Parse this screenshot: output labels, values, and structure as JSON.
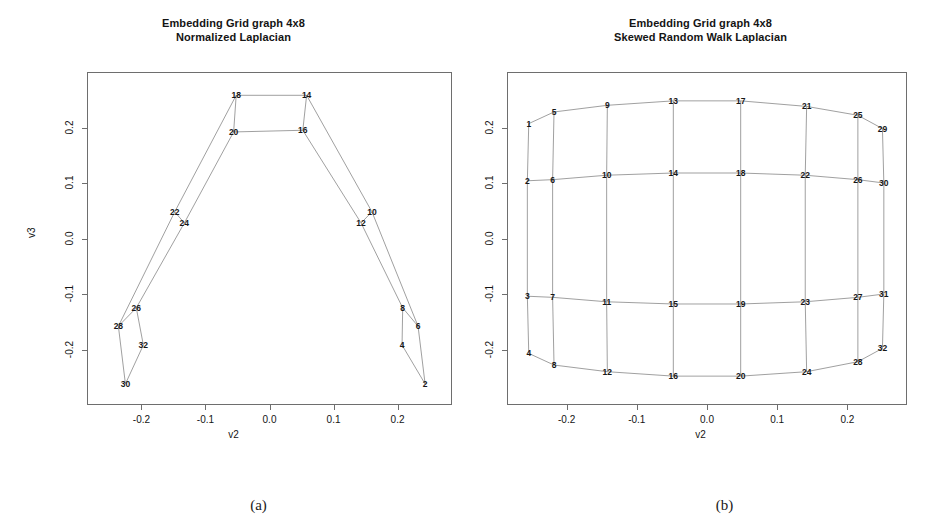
{
  "figure": {
    "panels": [
      {
        "caption": "(a)",
        "title_line1": "Embedding Grid graph 4x8",
        "title_line2": "Normalized Laplacian"
      },
      {
        "caption": "(b)",
        "title_line1": "Embedding Grid graph 4x8",
        "title_line2": "Skewed Random Walk  Laplacian"
      }
    ]
  },
  "chart_data": [
    {
      "type": "scatter",
      "title": "Embedding Grid graph 4x8 Normalized Laplacian",
      "xlabel": "v2",
      "ylabel": "v3",
      "xlim": [
        -0.285,
        0.285
      ],
      "ylim": [
        -0.3,
        0.3
      ],
      "xticks": [
        -0.2,
        -0.1,
        0.0,
        0.1,
        0.2
      ],
      "xticklabels": [
        "-0.2",
        "-0.1",
        "0.0",
        "0.1",
        "0.2"
      ],
      "yticks": [
        -0.2,
        -0.1,
        0.0,
        0.1,
        0.2
      ],
      "yticklabels": [
        "-0.2",
        "-0.1",
        "0.0",
        "0.1",
        "0.2"
      ],
      "grid": false,
      "legend": false,
      "point_labels": true,
      "nodes": [
        {
          "id": "2",
          "x": 0.243,
          "y": -0.262
        },
        {
          "id": "4",
          "x": 0.207,
          "y": -0.192
        },
        {
          "id": "6",
          "x": 0.232,
          "y": -0.158
        },
        {
          "id": "8",
          "x": 0.208,
          "y": -0.125
        },
        {
          "id": "10",
          "x": 0.16,
          "y": 0.048
        },
        {
          "id": "12",
          "x": 0.143,
          "y": 0.028
        },
        {
          "id": "14",
          "x": 0.058,
          "y": 0.258
        },
        {
          "id": "16",
          "x": 0.052,
          "y": 0.195
        },
        {
          "id": "18",
          "x": -0.052,
          "y": 0.258
        },
        {
          "id": "20",
          "x": -0.056,
          "y": 0.192
        },
        {
          "id": "22",
          "x": -0.148,
          "y": 0.048
        },
        {
          "id": "24",
          "x": -0.133,
          "y": 0.028
        },
        {
          "id": "26",
          "x": -0.208,
          "y": -0.125
        },
        {
          "id": "28",
          "x": -0.236,
          "y": -0.158
        },
        {
          "id": "30",
          "x": -0.225,
          "y": -0.262
        },
        {
          "id": "32",
          "x": -0.197,
          "y": -0.192
        }
      ],
      "edges": [
        [
          "18",
          "14"
        ],
        [
          "20",
          "16"
        ],
        [
          "18",
          "20"
        ],
        [
          "14",
          "16"
        ],
        [
          "18",
          "22"
        ],
        [
          "20",
          "24"
        ],
        [
          "14",
          "10"
        ],
        [
          "16",
          "12"
        ],
        [
          "22",
          "24"
        ],
        [
          "10",
          "12"
        ],
        [
          "22",
          "28"
        ],
        [
          "24",
          "26"
        ],
        [
          "10",
          "6"
        ],
        [
          "12",
          "8"
        ],
        [
          "26",
          "28"
        ],
        [
          "6",
          "8"
        ],
        [
          "28",
          "30"
        ],
        [
          "26",
          "32"
        ],
        [
          "6",
          "2"
        ],
        [
          "8",
          "4"
        ],
        [
          "30",
          "32"
        ],
        [
          "2",
          "4"
        ]
      ]
    },
    {
      "type": "scatter",
      "title": "Embedding Grid graph 4x8 Skewed Random Walk  Laplacian",
      "xlabel": "v2",
      "ylabel": "v3",
      "xlim": [
        -0.285,
        0.285
      ],
      "ylim": [
        -0.3,
        0.3
      ],
      "xticks": [
        -0.2,
        -0.1,
        0.0,
        0.1,
        0.2
      ],
      "xticklabels": [
        "-0.2",
        "-0.1",
        "0.0",
        "0.1",
        "0.2"
      ],
      "yticks": [
        -0.2,
        -0.1,
        0.0,
        0.1,
        0.2
      ],
      "yticklabels": [
        "-0.2",
        "-0.1",
        "0.0",
        "0.1",
        "0.2"
      ],
      "grid": false,
      "legend": false,
      "point_labels": true,
      "nodes": [
        {
          "id": "1",
          "x": -0.254,
          "y": 0.207
        },
        {
          "id": "2",
          "x": -0.256,
          "y": 0.104
        },
        {
          "id": "3",
          "x": -0.256,
          "y": -0.104
        },
        {
          "id": "4",
          "x": -0.254,
          "y": -0.207
        },
        {
          "id": "5",
          "x": -0.218,
          "y": 0.228
        },
        {
          "id": "6",
          "x": -0.22,
          "y": 0.106
        },
        {
          "id": "7",
          "x": -0.22,
          "y": -0.106
        },
        {
          "id": "8",
          "x": -0.218,
          "y": -0.228
        },
        {
          "id": "9",
          "x": -0.142,
          "y": 0.24
        },
        {
          "id": "10",
          "x": -0.143,
          "y": 0.114
        },
        {
          "id": "11",
          "x": -0.143,
          "y": -0.114
        },
        {
          "id": "12",
          "x": -0.142,
          "y": -0.24
        },
        {
          "id": "13",
          "x": -0.048,
          "y": 0.248
        },
        {
          "id": "14",
          "x": -0.048,
          "y": 0.118
        },
        {
          "id": "15",
          "x": -0.048,
          "y": -0.118
        },
        {
          "id": "16",
          "x": -0.048,
          "y": -0.248
        },
        {
          "id": "17",
          "x": 0.048,
          "y": 0.248
        },
        {
          "id": "18",
          "x": 0.048,
          "y": 0.118
        },
        {
          "id": "19",
          "x": 0.048,
          "y": -0.118
        },
        {
          "id": "20",
          "x": 0.048,
          "y": -0.248
        },
        {
          "id": "21",
          "x": 0.142,
          "y": 0.238
        },
        {
          "id": "22",
          "x": 0.14,
          "y": 0.114
        },
        {
          "id": "23",
          "x": 0.14,
          "y": -0.114
        },
        {
          "id": "24",
          "x": 0.142,
          "y": -0.24
        },
        {
          "id": "25",
          "x": 0.215,
          "y": 0.222
        },
        {
          "id": "26",
          "x": 0.215,
          "y": 0.106
        },
        {
          "id": "27",
          "x": 0.215,
          "y": -0.106
        },
        {
          "id": "28",
          "x": 0.215,
          "y": -0.222
        },
        {
          "id": "29",
          "x": 0.25,
          "y": 0.198
        },
        {
          "id": "30",
          "x": 0.252,
          "y": 0.1
        },
        {
          "id": "31",
          "x": 0.252,
          "y": -0.1
        },
        {
          "id": "32",
          "x": 0.25,
          "y": -0.198
        }
      ],
      "edges": [
        [
          "1",
          "2"
        ],
        [
          "2",
          "3"
        ],
        [
          "3",
          "4"
        ],
        [
          "5",
          "6"
        ],
        [
          "6",
          "7"
        ],
        [
          "7",
          "8"
        ],
        [
          "9",
          "10"
        ],
        [
          "10",
          "11"
        ],
        [
          "11",
          "12"
        ],
        [
          "13",
          "14"
        ],
        [
          "14",
          "15"
        ],
        [
          "15",
          "16"
        ],
        [
          "17",
          "18"
        ],
        [
          "18",
          "19"
        ],
        [
          "19",
          "20"
        ],
        [
          "21",
          "22"
        ],
        [
          "22",
          "23"
        ],
        [
          "23",
          "24"
        ],
        [
          "25",
          "26"
        ],
        [
          "26",
          "27"
        ],
        [
          "27",
          "28"
        ],
        [
          "29",
          "30"
        ],
        [
          "30",
          "31"
        ],
        [
          "31",
          "32"
        ],
        [
          "1",
          "5"
        ],
        [
          "5",
          "9"
        ],
        [
          "9",
          "13"
        ],
        [
          "13",
          "17"
        ],
        [
          "17",
          "21"
        ],
        [
          "21",
          "25"
        ],
        [
          "25",
          "29"
        ],
        [
          "2",
          "6"
        ],
        [
          "6",
          "10"
        ],
        [
          "10",
          "14"
        ],
        [
          "14",
          "18"
        ],
        [
          "18",
          "22"
        ],
        [
          "22",
          "26"
        ],
        [
          "26",
          "30"
        ],
        [
          "3",
          "7"
        ],
        [
          "7",
          "11"
        ],
        [
          "11",
          "15"
        ],
        [
          "15",
          "19"
        ],
        [
          "19",
          "23"
        ],
        [
          "23",
          "27"
        ],
        [
          "27",
          "31"
        ],
        [
          "4",
          "8"
        ],
        [
          "8",
          "12"
        ],
        [
          "12",
          "16"
        ],
        [
          "16",
          "20"
        ],
        [
          "20",
          "24"
        ],
        [
          "24",
          "28"
        ],
        [
          "28",
          "32"
        ]
      ]
    }
  ],
  "colors": {
    "frame": "#6e6e6e",
    "edge": "#777777",
    "text": "#141414",
    "background": "#ffffff"
  }
}
